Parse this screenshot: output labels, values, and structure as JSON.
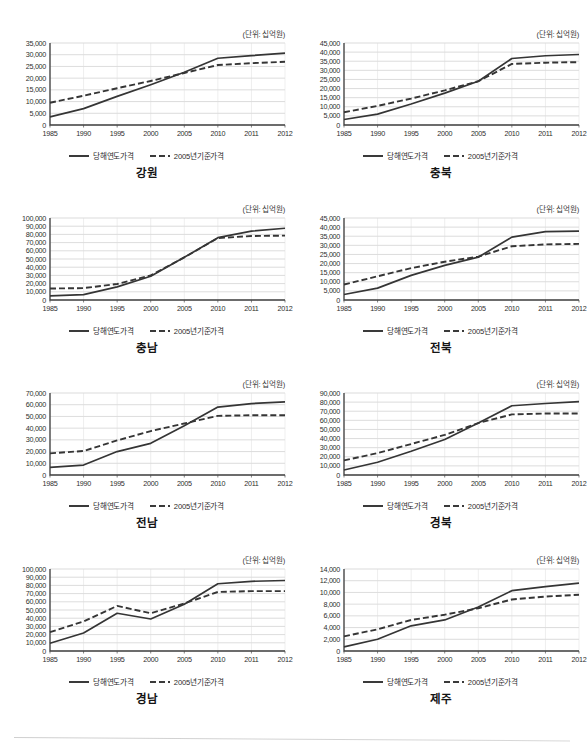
{
  "page": {
    "unit_note": "(단위: 십억원)",
    "legend": {
      "series1": "당해연도가격",
      "series2": "2005년기준가격"
    },
    "colors": {
      "line": "#333333",
      "grid": "#c8c8c8",
      "axis": "#444444",
      "text": "#1a1a1a"
    }
  },
  "chart_data": [
    {
      "type": "line",
      "title": "강원",
      "unit": "(단위: 십억원)",
      "xlabel": "",
      "ylabel": "",
      "x": [
        "1985",
        "1990",
        "1995",
        "2000",
        "2005",
        "2010",
        "2011",
        "2012"
      ],
      "ylim": [
        0,
        35000
      ],
      "yticks": [
        0,
        5000,
        10000,
        15000,
        20000,
        25000,
        30000,
        35000
      ],
      "ticklabels": [
        "0",
        "5,000",
        "10,000",
        "15,000",
        "20,000",
        "25,000",
        "30,000",
        "35,000"
      ],
      "grid": true,
      "legend_position": "bottom",
      "series": [
        {
          "name": "당해연도가격",
          "style": "solid",
          "values": [
            3500,
            7000,
            12200,
            17200,
            22500,
            28500,
            29600,
            30700
          ]
        },
        {
          "name": "2005년기준가격",
          "style": "dashed",
          "values": [
            9500,
            12500,
            15700,
            18800,
            22200,
            25600,
            26400,
            27000
          ]
        }
      ]
    },
    {
      "type": "line",
      "title": "충북",
      "unit": "(단위: 십억원)",
      "xlabel": "",
      "ylabel": "",
      "x": [
        "1985",
        "1990",
        "1995",
        "2000",
        "2005",
        "2010",
        "2011",
        "2012"
      ],
      "ylim": [
        0,
        45000
      ],
      "yticks": [
        0,
        5000,
        10000,
        15000,
        20000,
        25000,
        30000,
        35000,
        40000,
        45000
      ],
      "ticklabels": [
        "0",
        "5,000",
        "10,000",
        "15,000",
        "20,000",
        "25,000",
        "30,000",
        "35,000",
        "40,000",
        "45,000"
      ],
      "grid": true,
      "legend_position": "bottom",
      "series": [
        {
          "name": "당해연도가격",
          "style": "solid",
          "values": [
            3000,
            6000,
            11500,
            17500,
            24000,
            36500,
            38000,
            38700
          ]
        },
        {
          "name": "2005년기준가격",
          "style": "dashed",
          "values": [
            7000,
            10500,
            14500,
            19000,
            24000,
            33500,
            34200,
            34500
          ]
        }
      ]
    },
    {
      "type": "line",
      "title": "충남",
      "unit": "(단위: 십억원)",
      "xlabel": "",
      "ylabel": "",
      "x": [
        "1985",
        "1990",
        "1995",
        "2000",
        "2005",
        "2010",
        "2011",
        "2012"
      ],
      "ylim": [
        0,
        100000
      ],
      "yticks": [
        0,
        10000,
        20000,
        30000,
        40000,
        50000,
        60000,
        70000,
        80000,
        90000,
        100000
      ],
      "ticklabels": [
        "0",
        "10,000",
        "20,000",
        "30,000",
        "40,000",
        "50,000",
        "60,000",
        "70,000",
        "80,000",
        "90,000",
        "100,000"
      ],
      "grid": true,
      "legend_position": "bottom",
      "series": [
        {
          "name": "당해연도가격",
          "style": "solid",
          "values": [
            5000,
            6500,
            16000,
            29000,
            52000,
            76000,
            84000,
            87500
          ]
        },
        {
          "name": "2005년기준가격",
          "style": "dashed",
          "values": [
            14000,
            14500,
            19500,
            30000,
            52000,
            75500,
            78000,
            78500
          ]
        }
      ]
    },
    {
      "type": "line",
      "title": "전북",
      "unit": "(단위: 십억원)",
      "xlabel": "",
      "ylabel": "",
      "x": [
        "1985",
        "1990",
        "1995",
        "2000",
        "2005",
        "2010",
        "2011",
        "2012"
      ],
      "ylim": [
        0,
        45000
      ],
      "yticks": [
        0,
        5000,
        10000,
        15000,
        20000,
        25000,
        30000,
        35000,
        40000,
        45000
      ],
      "ticklabels": [
        "0",
        "5,000",
        "10,000",
        "15,000",
        "20,000",
        "25,000",
        "30,000",
        "35,000",
        "40,000",
        "45,000"
      ],
      "grid": true,
      "legend_position": "bottom",
      "series": [
        {
          "name": "당해연도가격",
          "style": "solid",
          "values": [
            3000,
            6500,
            13500,
            19000,
            23500,
            34500,
            37500,
            37800
          ]
        },
        {
          "name": "2005년기준가격",
          "style": "dashed",
          "values": [
            8500,
            13000,
            17500,
            21000,
            23800,
            29500,
            30500,
            30800
          ]
        }
      ]
    },
    {
      "type": "line",
      "title": "전남",
      "unit": "(단위: 십억원)",
      "xlabel": "",
      "ylabel": "",
      "x": [
        "1985",
        "1990",
        "1995",
        "2000",
        "2005",
        "2010",
        "2011",
        "2012"
      ],
      "ylim": [
        0,
        70000
      ],
      "yticks": [
        0,
        10000,
        20000,
        30000,
        40000,
        50000,
        60000,
        70000
      ],
      "ticklabels": [
        "0",
        "10,000",
        "20,000",
        "30,000",
        "40,000",
        "50,000",
        "60,000",
        "70,000"
      ],
      "grid": true,
      "legend_position": "bottom",
      "series": [
        {
          "name": "당해연도가격",
          "style": "solid",
          "values": [
            6500,
            8500,
            20000,
            27000,
            42000,
            58000,
            61000,
            62500
          ]
        },
        {
          "name": "2005년기준가격",
          "style": "dashed",
          "values": [
            18500,
            20500,
            29500,
            37500,
            44000,
            50500,
            51000,
            51000
          ]
        }
      ]
    },
    {
      "type": "line",
      "title": "경북",
      "unit": "(단위: 십억원)",
      "xlabel": "",
      "ylabel": "",
      "x": [
        "1985",
        "1990",
        "1995",
        "2000",
        "2005",
        "2010",
        "2011",
        "2012"
      ],
      "ylim": [
        0,
        90000
      ],
      "yticks": [
        0,
        10000,
        20000,
        30000,
        40000,
        50000,
        60000,
        70000,
        80000,
        90000
      ],
      "ticklabels": [
        "0",
        "10,000",
        "20,000",
        "30,000",
        "40,000",
        "50,000",
        "60,000",
        "70,000",
        "80,000",
        "90,000"
      ],
      "grid": true,
      "legend_position": "bottom",
      "series": [
        {
          "name": "당해연도가격",
          "style": "solid",
          "values": [
            5500,
            14000,
            26000,
            39000,
            57000,
            76000,
            78500,
            80500
          ]
        },
        {
          "name": "2005년기준가격",
          "style": "dashed",
          "values": [
            16000,
            24000,
            34000,
            44000,
            57000,
            66500,
            67500,
            67500
          ]
        }
      ]
    },
    {
      "type": "line",
      "title": "경남",
      "unit": "(단위: 십억원)",
      "xlabel": "",
      "ylabel": "",
      "x": [
        "1985",
        "1990",
        "1995",
        "2000",
        "2005",
        "2010",
        "2011",
        "2012"
      ],
      "ylim": [
        0,
        100000
      ],
      "yticks": [
        0,
        10000,
        20000,
        30000,
        40000,
        50000,
        60000,
        70000,
        80000,
        90000,
        100000
      ],
      "ticklabels": [
        "0",
        "10,000",
        "20,000",
        "30,000",
        "40,000",
        "50,000",
        "60,000",
        "70,000",
        "80,000",
        "90,000",
        "100,000"
      ],
      "grid": true,
      "legend_position": "bottom",
      "series": [
        {
          "name": "당해연도가격",
          "style": "solid",
          "values": [
            9500,
            22000,
            46000,
            39000,
            57000,
            82000,
            85000,
            86000
          ]
        },
        {
          "name": "2005년기준가격",
          "style": "dashed",
          "values": [
            23000,
            36000,
            55000,
            46000,
            58000,
            72000,
            73000,
            73000
          ]
        }
      ]
    },
    {
      "type": "line",
      "title": "제주",
      "unit": "(단위: 십억원)",
      "xlabel": "",
      "ylabel": "",
      "x": [
        "1985",
        "1990",
        "1995",
        "2000",
        "2005",
        "2010",
        "2011",
        "2012"
      ],
      "ylim": [
        0,
        14000
      ],
      "yticks": [
        0,
        2000,
        4000,
        6000,
        8000,
        10000,
        12000,
        14000
      ],
      "ticklabels": [
        "0",
        "2,000",
        "4,000",
        "6,000",
        "8,000",
        "10,000",
        "12,000",
        "14,000"
      ],
      "grid": true,
      "legend_position": "bottom",
      "series": [
        {
          "name": "당해연도가격",
          "style": "solid",
          "values": [
            700,
            2000,
            4300,
            5300,
            7500,
            10300,
            11000,
            11600
          ]
        },
        {
          "name": "2005년기준가격",
          "style": "dashed",
          "values": [
            2500,
            3700,
            5300,
            6200,
            7300,
            8800,
            9300,
            9600
          ]
        }
      ]
    }
  ]
}
